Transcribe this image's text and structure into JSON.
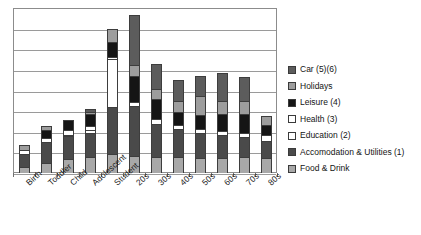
{
  "chart_data": {
    "type": "bar",
    "title": "",
    "subtitle": "",
    "xlabel": "",
    "ylabel": "",
    "grid": true,
    "stacked": true,
    "legend_position": "right",
    "ylim": [
      0,
      9
    ],
    "y_gridline_count": 9,
    "categories": [
      "Birth",
      "Toddler",
      "Child",
      "Adolescent",
      "Student",
      "20s",
      "30s",
      "40s",
      "50s",
      "60s",
      "70s",
      "80s"
    ],
    "series": [
      {
        "name": "Food & Drink",
        "color": "#a8a8a8",
        "values": [
          0.35,
          0.55,
          0.75,
          0.85,
          1.05,
          0.95,
          0.85,
          0.85,
          0.8,
          0.8,
          0.85,
          0.8
        ]
      },
      {
        "name": "Accomodation & Utilities (1)",
        "color": "#4a4a4a",
        "values": [
          0.7,
          1.15,
          1.25,
          1.35,
          2.55,
          2.7,
          1.85,
          1.55,
          1.4,
          1.25,
          1.1,
          0.95
        ]
      },
      {
        "name": "Education (2)",
        "color": "#ffffff",
        "values": [
          0.0,
          0.0,
          0.1,
          0.12,
          2.6,
          0.0,
          0.0,
          0.0,
          0.0,
          0.0,
          0.0,
          0.0
        ]
      },
      {
        "name": "Health (3)",
        "color": "#ffffff",
        "values": [
          0.18,
          0.22,
          0.22,
          0.22,
          0.15,
          0.22,
          0.22,
          0.22,
          0.22,
          0.22,
          0.22,
          0.3
        ]
      },
      {
        "name": "Leisure (4)",
        "color": "#151515",
        "values": [
          0.0,
          0.45,
          0.55,
          0.7,
          0.8,
          1.4,
          1.1,
          0.7,
          0.75,
          0.95,
          1.05,
          0.55
        ]
      },
      {
        "name": "Holidays",
        "color": "#9d9d9d",
        "values": [
          0.3,
          0.2,
          0.0,
          0.1,
          0.7,
          0.65,
          0.55,
          0.6,
          1.05,
          0.7,
          0.7,
          0.5
        ]
      },
      {
        "name": "Car (5)(6)",
        "color": "#5c5c5c",
        "values": [
          0.0,
          0.0,
          0.0,
          0.18,
          0.0,
          2.7,
          1.4,
          1.15,
          1.05,
          1.55,
          1.3,
          0.0
        ]
      }
    ],
    "legend": [
      {
        "label": "Car (5)(6)",
        "color": "#5c5c5c"
      },
      {
        "label": "Holidays",
        "color": "#9d9d9d"
      },
      {
        "label": "Leisure (4)",
        "color": "#151515"
      },
      {
        "label": "Health (3)",
        "color": "#ffffff"
      },
      {
        "label": "Education (2)",
        "color": "#ffffff"
      },
      {
        "label": "Accomodation & Utilities (1)",
        "color": "#4a4a4a"
      },
      {
        "label": "Food & Drink",
        "color": "#a8a8a8"
      }
    ]
  }
}
